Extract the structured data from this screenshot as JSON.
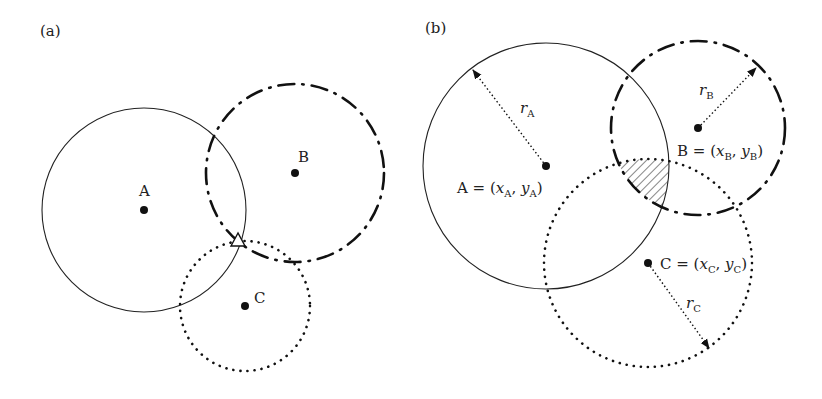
{
  "panels": [
    {
      "id": "a",
      "label": "(a)",
      "anchors": [
        {
          "name": "A",
          "label": "A",
          "cx": 144,
          "cy": 210,
          "r": 102,
          "style": "solid",
          "label_x": 139,
          "label_y": 196
        },
        {
          "name": "B",
          "label": "B",
          "cx": 295,
          "cy": 173,
          "r": 89,
          "style": "dash-dot",
          "label_x": 298,
          "label_y": 162
        },
        {
          "name": "C",
          "label": "C",
          "cx": 245,
          "cy": 306,
          "r": 65,
          "style": "dotted",
          "label_x": 254,
          "label_y": 303
        }
      ],
      "estimated_position": {
        "marker": "triangle",
        "x": 238,
        "y": 240
      }
    },
    {
      "id": "b",
      "label": "(b)",
      "anchors": [
        {
          "name": "A",
          "eq": "A = (",
          "x": "x",
          "xs": "A",
          "y": "y",
          "ys": "A",
          "radius_label": "r",
          "radius_sub": "A",
          "cx": 546,
          "cy": 166,
          "r": 123,
          "style": "solid"
        },
        {
          "name": "B",
          "eq": "B = (",
          "x": "x",
          "xs": "B",
          "y": "y",
          "ys": "B",
          "radius_label": "r",
          "radius_sub": "B",
          "cx": 698,
          "cy": 128,
          "r": 87,
          "style": "dash-dot"
        },
        {
          "name": "C",
          "eq": "C = (",
          "x": "x",
          "xs": "C",
          "y": "y",
          "ys": "C",
          "radius_label": "r",
          "radius_sub": "C",
          "cx": 648,
          "cy": 263,
          "r": 104,
          "style": "dotted"
        }
      ],
      "intersection_region": "hatched"
    }
  ],
  "text": {
    "panel_a": "(a)",
    "panel_b": "(b)",
    "a_A": "A",
    "a_B": "B",
    "a_C": "C",
    "b_A_pre": "A = (",
    "b_B_pre": "B = (",
    "b_C_pre": "C = (",
    "x": "x",
    "y": "y",
    "r": "r",
    "sub_A": "A",
    "sub_B": "B",
    "sub_C": "C",
    "comma": ", ",
    "close": ")"
  }
}
